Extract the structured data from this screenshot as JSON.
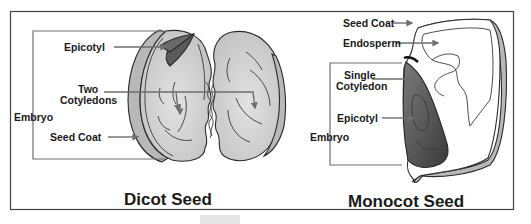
{
  "diagram": {
    "type": "labeled-illustration",
    "frame_color": "#444444",
    "background": "#ffffff",
    "dicot": {
      "title": "Dicot Seed",
      "labels": {
        "epicotyl": "Epicotyl",
        "cotyledons_line1": "Two",
        "cotyledons_line2": "Cotyledons",
        "embryo": "Embryo",
        "seed_coat": "Seed Coat"
      }
    },
    "monocot": {
      "title": "Monocot Seed",
      "labels": {
        "seed_coat": "Seed Coat",
        "endosperm": "Endosperm",
        "cotyledon_line1": "Single",
        "cotyledon_line2": "Cotyledon",
        "epicotyl": "Epicotyl",
        "embryo": "Embryo"
      }
    },
    "colors": {
      "cotyledon_fill": "#d4d4d4",
      "seed_coat_fill": "#b8b8b8",
      "epicotyl_fill": "#5a5a5a",
      "monocot_embryo_fill": "#4a4a4a",
      "endosperm_fill": "#f4f4f4",
      "leader_color": "#6e6e6e"
    }
  }
}
